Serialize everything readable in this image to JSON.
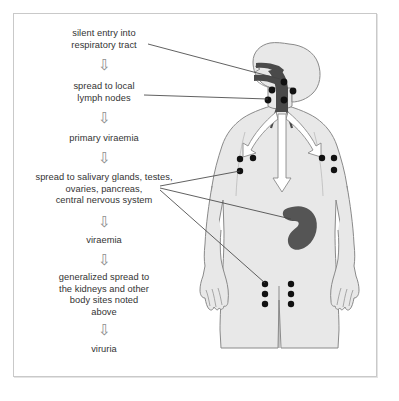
{
  "diagram": {
    "colors": {
      "frame_border": "#c9c9c9",
      "text": "#333333",
      "arrow_outline": "#8e8e8e",
      "body_fill": "#e8e8e8",
      "body_outline": "#8a8a8a",
      "respiratory_tract": "#4a4a4a",
      "organ": "#555555",
      "lymph_node": "#111111",
      "leader_line": "#444444"
    },
    "flow": {
      "steps": [
        {
          "id": "step-1",
          "text": "silent entry into\nrespiratory tract"
        },
        {
          "id": "step-2",
          "text": "spread to local\nlymph nodes"
        },
        {
          "id": "step-3",
          "text": "primary viraemia"
        },
        {
          "id": "step-4",
          "text": "spread to salivary glands, testes,\novaries, pancreas,\ncentral nervous system"
        },
        {
          "id": "step-5",
          "text": "viraemia"
        },
        {
          "id": "step-6",
          "text": "generalized spread to\nthe kidneys and other\nbody sites noted\nabove"
        },
        {
          "id": "step-7",
          "text": "viruria"
        }
      ],
      "connector_glyph": "⇩",
      "connector_count": 6
    },
    "body": {
      "label": "human-body-figure",
      "parts": [
        {
          "name": "head",
          "label": "head"
        },
        {
          "name": "respiratory-tract",
          "label": "nasal passage, pharynx and trachea"
        },
        {
          "name": "neck-lymph-nodes",
          "label": "cervical lymph nodes",
          "count": 5
        },
        {
          "name": "left-axillary-lymph-nodes",
          "label": "left axillary lymph nodes",
          "count": 3
        },
        {
          "name": "right-axillary-lymph-nodes",
          "label": "right axillary lymph nodes",
          "count": 3
        },
        {
          "name": "abdominal-organ",
          "label": "kidney / visceral organ"
        },
        {
          "name": "inguinal-lymph-nodes",
          "label": "inguinal lymph nodes",
          "count": 6
        },
        {
          "name": "bronchial-arrows",
          "label": "spread arrows into lungs and body",
          "count": 3
        }
      ]
    },
    "leader_lines": [
      {
        "id": "leader-respiratory",
        "from_step": "step-1",
        "to_part": "respiratory-tract"
      },
      {
        "id": "leader-lymph",
        "from_step": "step-2",
        "to_part": "neck-lymph-nodes"
      },
      {
        "id": "leader-axillary",
        "from_step": "step-4",
        "to_part": "left-axillary-lymph-nodes"
      },
      {
        "id": "leader-organ",
        "from_step": "step-4",
        "to_part": "abdominal-organ"
      },
      {
        "id": "leader-inguinal",
        "from_step": "step-4",
        "to_part": "inguinal-lymph-nodes"
      }
    ]
  }
}
